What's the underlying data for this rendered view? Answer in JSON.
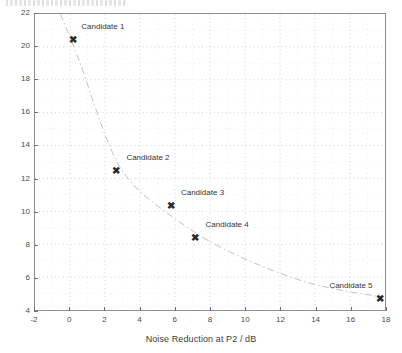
{
  "figure": {
    "top_artifact_note": "scan-noise-strip",
    "background_color": "#ffffff",
    "frame_color": "#8c8c8c",
    "marker_glyph": "✖"
  },
  "chart_data": {
    "type": "scatter",
    "title": "",
    "xlabel": "Noise Reduction at P2 / dB",
    "ylabel": "",
    "xlim": [
      -2,
      18
    ],
    "ylim": [
      4,
      22
    ],
    "xticks": [
      -2,
      0,
      2,
      4,
      6,
      8,
      10,
      12,
      14,
      16,
      18
    ],
    "xtick_labels": [
      "-2",
      "0",
      "2",
      "4",
      "6",
      "8",
      "10",
      "12",
      "14",
      "16",
      "18"
    ],
    "yticks": [
      4,
      6,
      8,
      10,
      12,
      14,
      16,
      18,
      20,
      22
    ],
    "ytick_labels": [
      "4",
      "6",
      "8",
      "10",
      "12",
      "14",
      "16",
      "18",
      "20",
      "22"
    ],
    "grid": true,
    "grid_style": "dotted",
    "minor_grid": true,
    "legend": false,
    "points": [
      {
        "label": "Candidate 1",
        "x": 0.15,
        "y": 20.45,
        "label_dx": 30,
        "label_dy": -13
      },
      {
        "label": "Candidate 2",
        "x": 2.6,
        "y": 12.5,
        "label_dx": 32,
        "label_dy": -13
      },
      {
        "label": "Candidate 3",
        "x": 5.7,
        "y": 10.4,
        "label_dx": 32,
        "label_dy": -13
      },
      {
        "label": "Candidate 4",
        "x": 7.1,
        "y": 8.5,
        "label_dx": 32,
        "label_dy": -13
      },
      {
        "label": "Candidate 5",
        "x": 17.6,
        "y": 4.8,
        "label_dx": -29,
        "label_dy": -13
      }
    ],
    "trend_curve": {
      "style": "dash-dot",
      "color": "#b9b9b9",
      "points": [
        {
          "x": -0.55,
          "y": 22.0
        },
        {
          "x": 0.55,
          "y": 19.1
        },
        {
          "x": 1.35,
          "y": 16.6
        },
        {
          "x": 2.1,
          "y": 14.4
        },
        {
          "x": 2.9,
          "y": 12.6
        },
        {
          "x": 4.0,
          "y": 11.2
        },
        {
          "x": 5.3,
          "y": 10.1
        },
        {
          "x": 6.6,
          "y": 9.1
        },
        {
          "x": 8.1,
          "y": 8.1
        },
        {
          "x": 9.8,
          "y": 7.2
        },
        {
          "x": 11.6,
          "y": 6.4
        },
        {
          "x": 13.5,
          "y": 5.7
        },
        {
          "x": 15.5,
          "y": 5.2
        },
        {
          "x": 17.8,
          "y": 4.8
        }
      ]
    }
  }
}
